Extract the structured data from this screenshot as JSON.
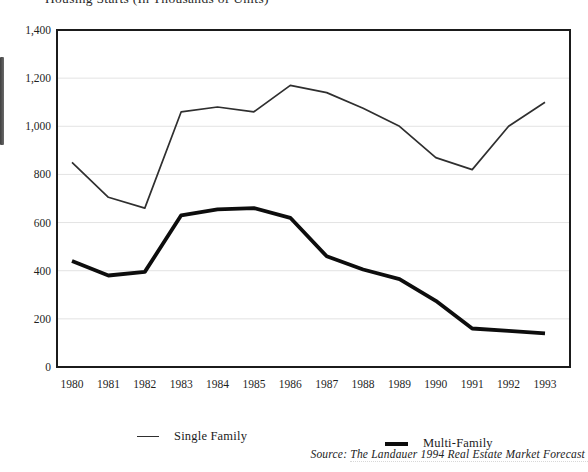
{
  "header": {
    "clipped_title_fragment": "Housing Starts (In Thousands of Units)"
  },
  "footer": {
    "source": "Source: The Landauer 1994 Real Estate Market Forecast"
  },
  "chart_data": {
    "type": "line",
    "title": "",
    "xlabel": "",
    "ylabel": "",
    "categories": [
      "1980",
      "1981",
      "1982",
      "1983",
      "1984",
      "1985",
      "1986",
      "1987",
      "1988",
      "1989",
      "1990",
      "1991",
      "1992",
      "1993"
    ],
    "series": [
      {
        "name": "Single Family",
        "color": "#2f2f2f",
        "stroke_width": 1.7,
        "values": [
          850,
          705,
          660,
          1060,
          1080,
          1060,
          1170,
          1140,
          1075,
          1000,
          870,
          820,
          1000,
          1100
        ]
      },
      {
        "name": "Multi-Family",
        "color": "#0d0d0d",
        "stroke_width": 3.8,
        "values": [
          440,
          380,
          395,
          630,
          655,
          660,
          620,
          460,
          405,
          365,
          275,
          160,
          150,
          140
        ]
      }
    ],
    "ylim": [
      0,
      1400
    ],
    "y_ticks": [
      {
        "value": 0,
        "label": "0"
      },
      {
        "value": 200,
        "label": "200"
      },
      {
        "value": 400,
        "label": "400"
      },
      {
        "value": 600,
        "label": "600"
      },
      {
        "value": 800,
        "label": "800"
      },
      {
        "value": 1000,
        "label": "1,000"
      },
      {
        "value": 1200,
        "label": "1,200"
      },
      {
        "value": 1400,
        "label": "1,400"
      }
    ],
    "grid": true,
    "legend_position": "bottom"
  }
}
